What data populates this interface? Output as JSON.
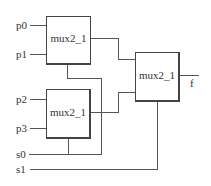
{
  "diagram": {
    "type": "circuit",
    "colors": {
      "wire": "#555555",
      "box": "#444444",
      "text": "#333333",
      "background": "#ffffff"
    },
    "inputs": [
      {
        "id": "p0",
        "label": "p0"
      },
      {
        "id": "p1",
        "label": "p1"
      },
      {
        "id": "p2",
        "label": "p2"
      },
      {
        "id": "p3",
        "label": "p3"
      },
      {
        "id": "s0",
        "label": "s0"
      },
      {
        "id": "s1",
        "label": "s1"
      }
    ],
    "outputs": [
      {
        "id": "f",
        "label": "f"
      }
    ],
    "blocks": [
      {
        "id": "mux_a",
        "label": "mux2_1",
        "inputs": [
          "p0",
          "p1"
        ],
        "select": "s0"
      },
      {
        "id": "mux_b",
        "label": "mux2_1",
        "inputs": [
          "p2",
          "p3"
        ],
        "select": "s0"
      },
      {
        "id": "mux_c",
        "label": "mux2_1",
        "inputs": [
          "mux_a",
          "mux_b"
        ],
        "select": "s1",
        "output": "f"
      }
    ]
  }
}
